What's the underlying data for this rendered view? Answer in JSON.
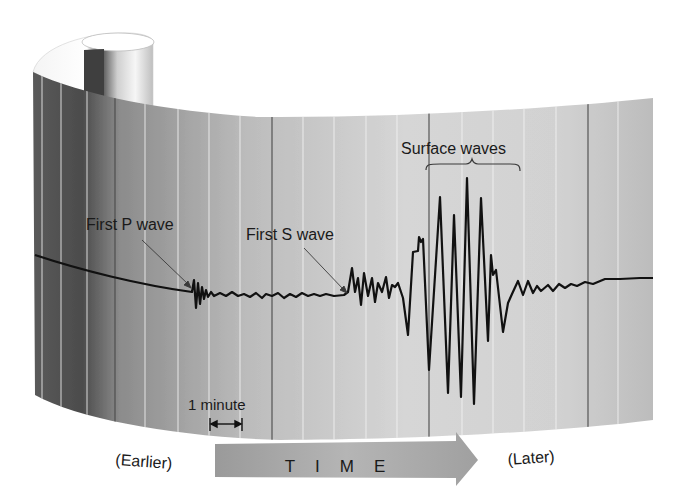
{
  "diagram": {
    "labels": {
      "first_p_wave": "First P wave",
      "first_s_wave": "First S wave",
      "surface_waves": "Surface waves",
      "one_minute": "1 minute",
      "earlier": "(Earlier)",
      "later": "(Later)",
      "time": "TIME"
    },
    "colors": {
      "trace": "#111111",
      "paper_dark": "#6e6e6e",
      "paper_light": "#d8d8d8",
      "arrow": "#a8a8a8",
      "text": "#1a1a1a"
    },
    "sequence": [
      "First P wave",
      "First S wave",
      "Surface waves"
    ],
    "scale": "1 minute between adjacent minor grid lines"
  }
}
